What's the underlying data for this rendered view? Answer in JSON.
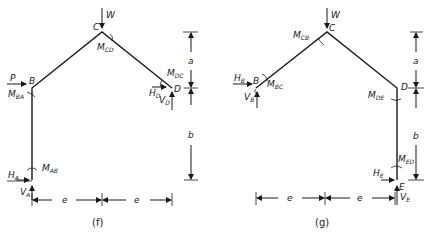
{
  "figures": [
    {
      "caption": "(f)",
      "nodes": {
        "A": "A",
        "B": "B",
        "C": "C",
        "D": "D"
      },
      "loads": {
        "W": "W",
        "P": "P"
      },
      "moments": {
        "CD": "CD",
        "BA": "BA",
        "DC": "DC",
        "AB": "AB"
      },
      "reactions": {
        "HD": "D",
        "VD": "D",
        "HA": "A",
        "VA": "A"
      },
      "dims": {
        "a": "a",
        "b": "b",
        "e1": "e",
        "e2": "e"
      }
    },
    {
      "caption": "(g)",
      "nodes": {
        "B": "B",
        "C": "C",
        "D": "D",
        "E": "E"
      },
      "loads": {
        "W": "W"
      },
      "moments": {
        "CB": "CB",
        "BC": "BC",
        "DE": "DE",
        "ED": "ED"
      },
      "reactions": {
        "HB": "B",
        "VB": "B",
        "HE": "E",
        "VE": "E"
      },
      "dims": {
        "a": "a",
        "b": "b",
        "e1": "e",
        "e2": "e"
      }
    }
  ],
  "symbols": {
    "M": "M",
    "H": "H",
    "V": "V"
  },
  "colors": {
    "ink": "#1a1a1a",
    "background": "#ffffff"
  }
}
